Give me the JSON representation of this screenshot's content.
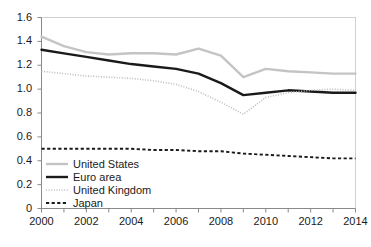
{
  "chart_data": {
    "type": "line",
    "title": "",
    "subtitle": "",
    "xlabel": "",
    "ylabel": "",
    "xlim": [
      2000,
      2014
    ],
    "ylim": [
      0,
      1.6
    ],
    "yticks": [
      "0",
      "0.2",
      "0.4",
      "0.6",
      "0.8",
      "1.0",
      "1.2",
      "1.4",
      "1.6"
    ],
    "ytick_values": [
      0,
      0.2,
      0.4,
      0.6,
      0.8,
      1.0,
      1.2,
      1.4,
      1.6
    ],
    "xticks": [
      "2000",
      "2002",
      "2004",
      "2006",
      "2008",
      "2010",
      "2012",
      "2014"
    ],
    "xtick_values": [
      2000,
      2002,
      2004,
      2006,
      2008,
      2010,
      2012,
      2014
    ],
    "x": [
      2000,
      2001,
      2002,
      2003,
      2004,
      2005,
      2006,
      2007,
      2008,
      2009,
      2010,
      2011,
      2012,
      2013,
      2014
    ],
    "grid": false,
    "legend_position": "lower-left",
    "series": [
      {
        "name": "United States",
        "color": "#c4c4c4",
        "style": "solid",
        "values": [
          1.44,
          1.36,
          1.31,
          1.29,
          1.3,
          1.3,
          1.29,
          1.34,
          1.28,
          1.1,
          1.17,
          1.15,
          1.14,
          1.13,
          1.13
        ]
      },
      {
        "name": "Euro area",
        "color": "#1a1a1a",
        "style": "solid",
        "values": [
          1.33,
          1.3,
          1.27,
          1.24,
          1.21,
          1.19,
          1.17,
          1.13,
          1.05,
          0.95,
          0.97,
          0.99,
          0.98,
          0.97,
          0.97
        ]
      },
      {
        "name": "United Kingdom",
        "color": "#bdbdbd",
        "style": "dotted",
        "values": [
          1.15,
          1.13,
          1.11,
          1.1,
          1.09,
          1.07,
          1.04,
          0.98,
          0.89,
          0.79,
          0.93,
          0.97,
          0.99,
          1.0,
          0.99
        ]
      },
      {
        "name": "Japan",
        "color": "#1a1a1a",
        "style": "dashed",
        "values": [
          0.5,
          0.5,
          0.5,
          0.5,
          0.5,
          0.49,
          0.49,
          0.48,
          0.48,
          0.46,
          0.45,
          0.44,
          0.43,
          0.42,
          0.42
        ]
      }
    ]
  },
  "legend": {
    "items": [
      {
        "label": "United States"
      },
      {
        "label": "Euro area"
      },
      {
        "label": "United Kingdom"
      },
      {
        "label": "Japan"
      }
    ]
  }
}
